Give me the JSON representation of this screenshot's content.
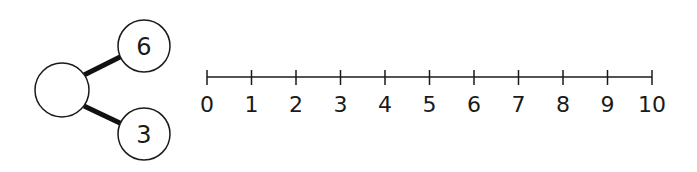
{
  "part_whole_model": {
    "whole": "",
    "parts": [
      "6",
      "3"
    ]
  },
  "number_line": {
    "start": 0,
    "end": 10,
    "labels": [
      "0",
      "1",
      "2",
      "3",
      "4",
      "5",
      "6",
      "7",
      "8",
      "9",
      "10"
    ]
  },
  "colors": {
    "stroke": "#1a1a1a",
    "background": "#ffffff"
  }
}
